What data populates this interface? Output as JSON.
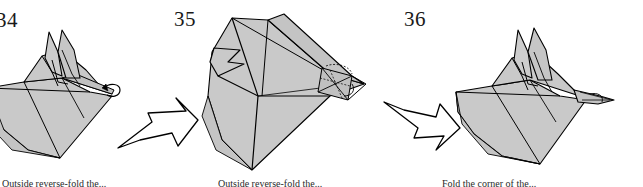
{
  "page": {
    "background_color": "#ffffff",
    "ink_color": "#000000",
    "paper_fill_color": "#c9c9c9",
    "paper_fill_dark_color": "#b4b4b4"
  },
  "steps": [
    {
      "number": "34",
      "caption": "Outside reverse-fold the...",
      "figure_name": "origami-figure-34",
      "description": "Folded model with two upright ear points and a small curl arrow at the right tip"
    },
    {
      "number": "35",
      "caption": "Outside reverse-fold the...",
      "figure_name": "origami-figure-35",
      "description": "Wide fan-shaped model seen from another angle with crease detail at the right tip"
    },
    {
      "number": "36",
      "caption": "Fold the corner of the...",
      "figure_name": "origami-figure-36",
      "description": "Completed shape with narrow pointed beak at the right"
    }
  ],
  "arrows": [
    {
      "name": "process-arrow-1",
      "direction": "right-up"
    },
    {
      "name": "process-arrow-2",
      "direction": "right-down"
    }
  ]
}
